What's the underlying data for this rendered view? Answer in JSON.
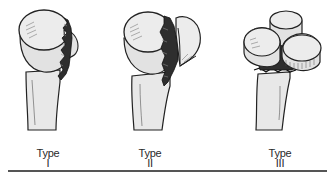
{
  "figure": {
    "colors": {
      "bone_fill": "#e6e6e6",
      "outline": "#222222",
      "fracture_fill": "#333333",
      "rule": "#555555"
    },
    "panels": [
      {
        "id": "type-1",
        "label_word": "Type",
        "label_numeral": "I",
        "description_icon": "humeral-head-fracture-one-fragment-icon"
      },
      {
        "id": "type-2",
        "label_word": "Type",
        "label_numeral": "II",
        "description_icon": "humeral-head-fracture-two-fragment-icon"
      },
      {
        "id": "type-3",
        "label_word": "Type",
        "label_numeral": "III",
        "description_icon": "humeral-head-fracture-comminuted-icon"
      }
    ]
  }
}
